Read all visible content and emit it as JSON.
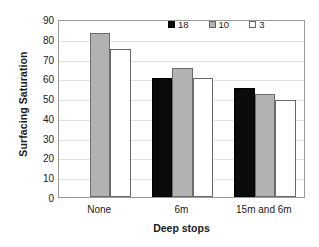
{
  "chart_data": {
    "type": "bar",
    "title": "",
    "xlabel": "Deep stops",
    "ylabel": "Surfacing Saturation",
    "categories": [
      "None",
      "6m",
      "15m and 6m"
    ],
    "ylim": [
      0,
      90
    ],
    "yticks": [
      0,
      10,
      20,
      30,
      40,
      50,
      60,
      70,
      80,
      90
    ],
    "grid": true,
    "legend_position": "top-right",
    "series": [
      {
        "name": "18",
        "color": "#0a0a0a",
        "values": [
          null,
          60,
          55
        ]
      },
      {
        "name": "10",
        "color": "#b2b2b2",
        "values": [
          83,
          65,
          52
        ]
      },
      {
        "name": "3",
        "color": "#ffffff",
        "values": [
          75,
          60,
          49
        ]
      }
    ]
  }
}
